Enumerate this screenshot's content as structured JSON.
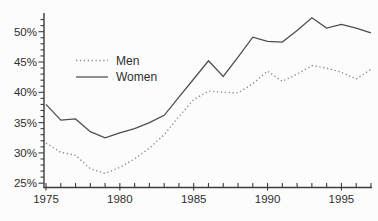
{
  "chart_data": {
    "type": "line",
    "title": "",
    "xlabel": "",
    "ylabel": "",
    "grid": false,
    "legend_position": "upper-left-inside",
    "x": [
      1975,
      1976,
      1977,
      1978,
      1979,
      1980,
      1981,
      1982,
      1983,
      1984,
      1985,
      1986,
      1987,
      1988,
      1989,
      1990,
      1991,
      1992,
      1993,
      1994,
      1995,
      1996,
      1997
    ],
    "series": [
      {
        "name": "Men",
        "line_style": "dotted",
        "values": [
          31.6,
          30.1,
          29.6,
          27.4,
          26.6,
          27.6,
          29.0,
          30.8,
          33.0,
          36.0,
          38.8,
          40.2,
          40.0,
          39.9,
          41.4,
          43.5,
          41.8,
          43.0,
          44.4,
          44.0,
          43.3,
          42.2,
          43.8
        ]
      },
      {
        "name": "Women",
        "line_style": "solid",
        "values": [
          38.0,
          35.4,
          35.6,
          33.5,
          32.5,
          33.3,
          34.0,
          35.0,
          36.2,
          39.2,
          42.2,
          45.2,
          42.6,
          45.8,
          49.1,
          48.4,
          48.3,
          50.2,
          52.3,
          50.6,
          51.2,
          50.6,
          49.8
        ]
      }
    ],
    "x_axis": {
      "range": [
        1975,
        1997
      ],
      "minor_tick_every": 1,
      "labeled_ticks": [
        1975,
        1980,
        1985,
        1990,
        1995
      ],
      "tick_labels": [
        "1975",
        "1980",
        "1985",
        "1990",
        "1995"
      ]
    },
    "y_axis": {
      "range": [
        25,
        52.5
      ],
      "minor_tick_every": 1,
      "labeled_ticks": [
        25,
        30,
        35,
        40,
        45,
        50
      ],
      "tick_labels": [
        "25%",
        "30%",
        "35%",
        "40%",
        "45%",
        "50%"
      ]
    }
  },
  "colors": {
    "background": "#fcfcfc",
    "axis": "#3c3c3c",
    "text": "#2e2e2e",
    "women_line": "#4d4d4d",
    "men_line": "#8c8c8c"
  }
}
